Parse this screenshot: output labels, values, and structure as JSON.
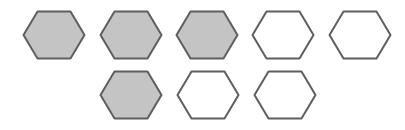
{
  "diagram": {
    "title": "",
    "colors": {
      "filled": "#c4c4c4",
      "empty": "#ffffff",
      "stroke": "#5e5e5e"
    },
    "hexagons": [
      {
        "row": 1,
        "index": 1,
        "cx": 54,
        "cy": 35,
        "filled": true
      },
      {
        "row": 1,
        "index": 2,
        "cx": 131,
        "cy": 35,
        "filled": true
      },
      {
        "row": 1,
        "index": 3,
        "cx": 207,
        "cy": 35,
        "filled": true
      },
      {
        "row": 1,
        "index": 4,
        "cx": 283,
        "cy": 35,
        "filled": false
      },
      {
        "row": 1,
        "index": 5,
        "cx": 360,
        "cy": 35,
        "filled": false
      },
      {
        "row": 2,
        "index": 1,
        "cx": 131,
        "cy": 95,
        "filled": true
      },
      {
        "row": 2,
        "index": 2,
        "cx": 208,
        "cy": 95,
        "filled": false
      },
      {
        "row": 2,
        "index": 3,
        "cx": 285,
        "cy": 95,
        "filled": false
      }
    ],
    "summary": {
      "row1_filled": 3,
      "row1_total": 5,
      "row2_filled": 1,
      "row2_total": 3
    }
  }
}
